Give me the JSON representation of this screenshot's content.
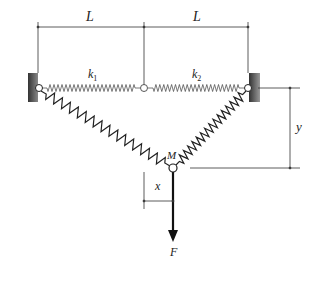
{
  "diagram": {
    "labels": {
      "L_left": "L",
      "L_right": "L",
      "k1": "k",
      "k1_sub": "1",
      "k2": "k",
      "k2_sub": "2",
      "mass": "M",
      "x": "x",
      "y": "y",
      "force": "F"
    },
    "colors": {
      "line": "#333333",
      "wall": "#555555",
      "background": "#ffffff"
    }
  }
}
